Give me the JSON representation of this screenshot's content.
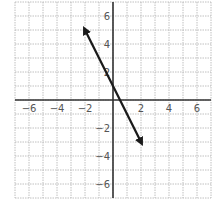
{
  "chart_data": {
    "type": "line",
    "title": "",
    "xlabel": "",
    "ylabel": "",
    "xlim": [
      -7,
      7
    ],
    "ylim": [
      -7,
      7
    ],
    "grid": true,
    "x_ticks": [
      -6,
      -4,
      -2,
      2,
      4,
      6
    ],
    "y_ticks": [
      6,
      4,
      2,
      -2,
      -4,
      -6
    ],
    "x_tick_labels": [
      "−6",
      "−4",
      "−2",
      "2",
      "4",
      "6"
    ],
    "y_tick_labels": [
      "6",
      "4",
      "2",
      "−2",
      "−4",
      "−6"
    ],
    "series": [
      {
        "name": "line",
        "equation": "y = -2x + 1",
        "points": [
          [
            -2,
            5
          ],
          [
            2,
            -3
          ]
        ],
        "arrows": "both",
        "color": "#1a1a1a"
      }
    ]
  },
  "colors": {
    "grid": "#b0b0b0",
    "axis": "#333333",
    "line": "#1a1a1a"
  }
}
